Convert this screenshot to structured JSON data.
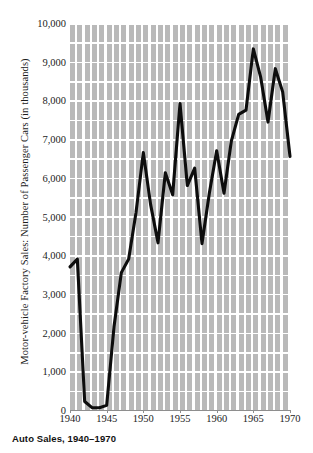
{
  "chart_data": {
    "type": "line",
    "title": "Auto Sales, 1940–1970",
    "xlabel": "",
    "ylabel": "Motor-vehicle Factory Sales: Number of Passenger Cars (in thousands)",
    "xlim": [
      1940,
      1970
    ],
    "ylim": [
      0,
      10000
    ],
    "grid": true,
    "legend_position": "none",
    "xticks": [
      "1940",
      "1945",
      "1950",
      "1955",
      "1960",
      "1965",
      "1970"
    ],
    "xtick_values": [
      1940,
      1945,
      1950,
      1955,
      1960,
      1965,
      1970
    ],
    "yticks": [
      "0",
      "1,000",
      "2,000",
      "3,000",
      "4,000",
      "5,000",
      "6,000",
      "7,000",
      "8,000",
      "9,000",
      "10,000"
    ],
    "ytick_values": [
      0,
      1000,
      2000,
      3000,
      4000,
      5000,
      6000,
      7000,
      8000,
      9000,
      10000
    ],
    "x": [
      1940,
      1941,
      1942,
      1943,
      1944,
      1945,
      1946,
      1947,
      1948,
      1949,
      1950,
      1951,
      1952,
      1953,
      1954,
      1955,
      1956,
      1957,
      1958,
      1959,
      1960,
      1961,
      1962,
      1963,
      1964,
      1965,
      1966,
      1967,
      1968,
      1969,
      1970
    ],
    "series": [
      {
        "name": "Passenger cars produced",
        "color": "#0d0d0d",
        "values": [
          3700,
          3900,
          220,
          60,
          60,
          120,
          2150,
          3550,
          3900,
          5100,
          6650,
          5300,
          4320,
          6130,
          5560,
          7920,
          5800,
          6250,
          4300,
          5600,
          6700,
          5600,
          6950,
          7640,
          7750,
          9330,
          8600,
          7440,
          8820,
          8220,
          6550
        ]
      }
    ]
  },
  "caption": {
    "text": "Auto Sales, 1940–1970"
  },
  "axes": {
    "y_title": "Motor-vehicle Factory Sales: Number of Passenger Cars (in thousands)"
  },
  "colors": {
    "plot_background": "#b9b9b9",
    "gridline": "#ffffff",
    "line": "#0d0d0d",
    "text": "#1c1c1c",
    "page_background": "#ffffff"
  }
}
